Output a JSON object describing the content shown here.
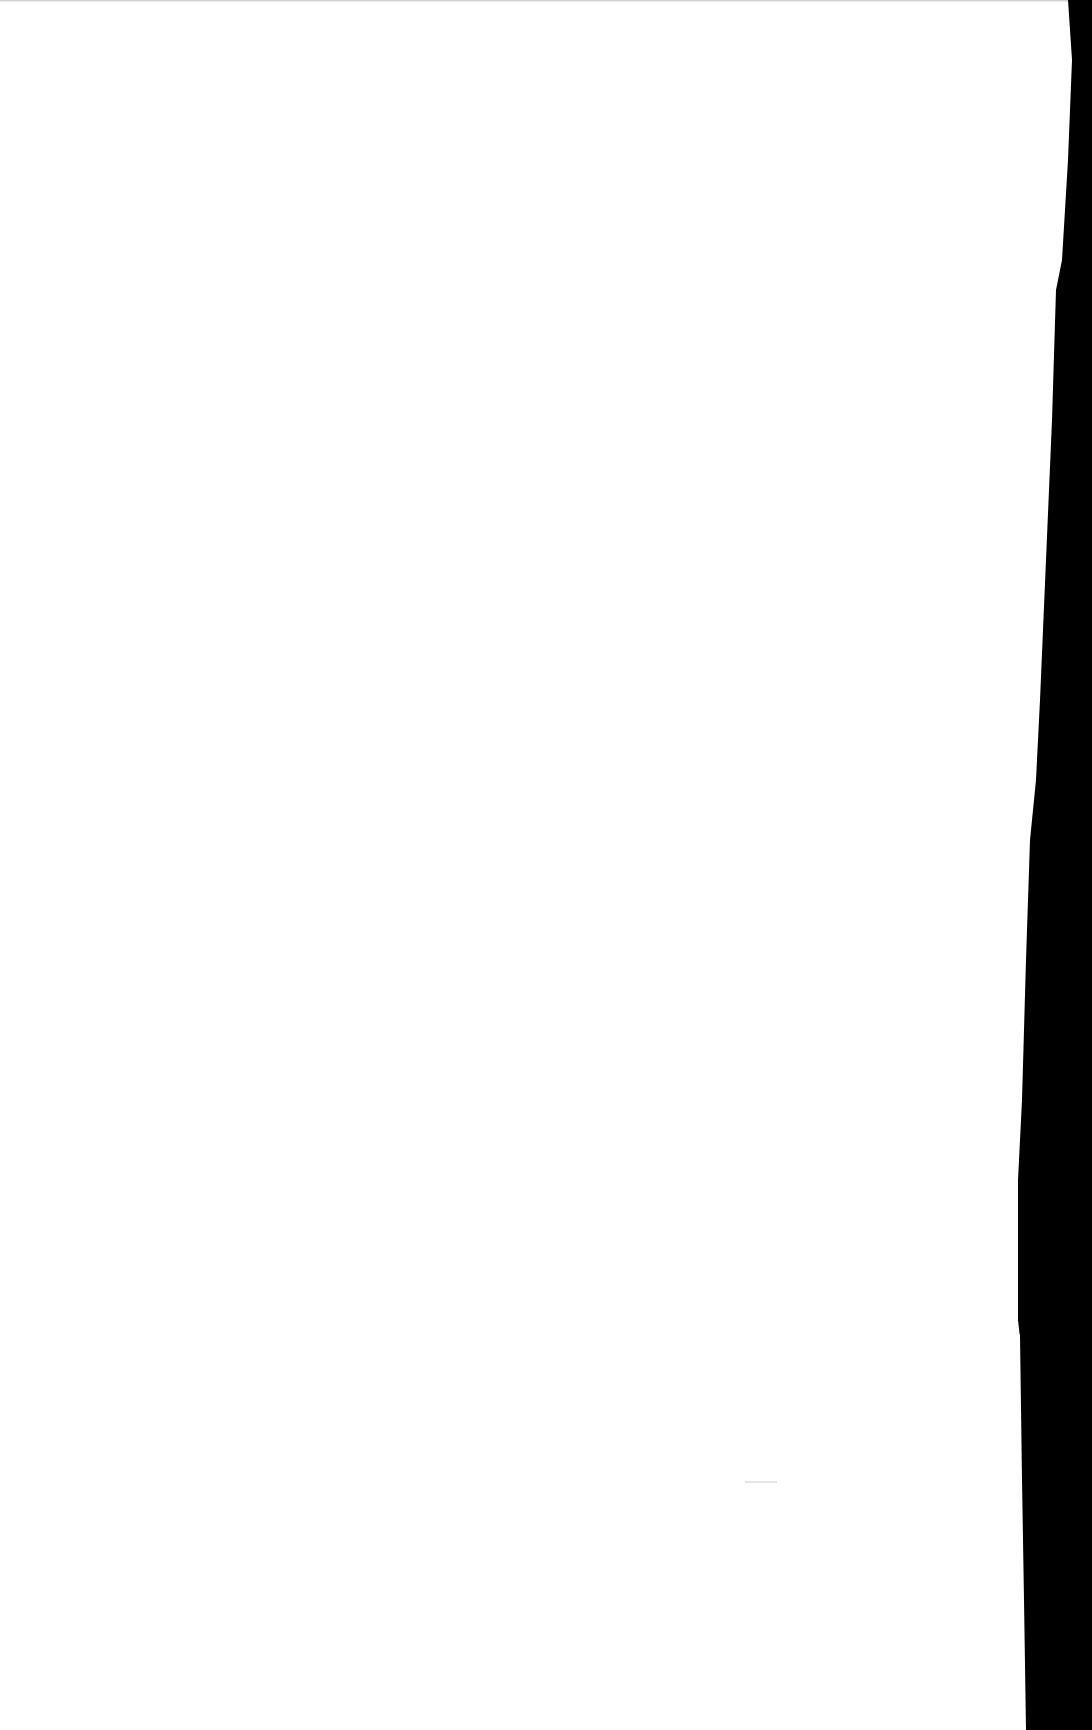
{
  "page": {
    "content": "",
    "background_color": "#ffffff",
    "edge_color": "#000000"
  }
}
